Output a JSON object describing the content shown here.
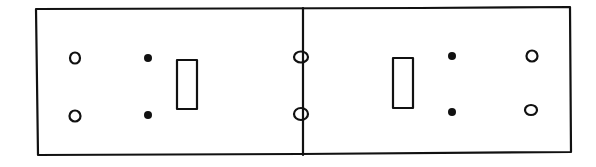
{
  "diagram": {
    "title": "",
    "stroke_color": "#111111",
    "background": "#ffffff",
    "frame": {
      "x": 36,
      "y": 8,
      "width": 535,
      "height": 147
    },
    "divider_x": 303,
    "plates": [
      {
        "name": "left",
        "screw_holes": [
          {
            "cx": 74,
            "cy": 58
          },
          {
            "cx": 75,
            "cy": 116
          }
        ],
        "dots": [
          {
            "cx": 148,
            "cy": 58
          },
          {
            "cx": 148,
            "cy": 115
          }
        ],
        "toggle_slot": {
          "x": 177,
          "y": 60,
          "width": 20,
          "height": 49
        }
      },
      {
        "name": "right",
        "screw_holes": [
          {
            "cx": 532,
            "cy": 56
          },
          {
            "cx": 531,
            "cy": 110
          }
        ],
        "dots": [
          {
            "cx": 452,
            "cy": 56
          },
          {
            "cx": 452,
            "cy": 112
          }
        ],
        "toggle_slot": {
          "x": 393,
          "y": 58,
          "width": 20,
          "height": 50
        }
      }
    ],
    "shared_holes": [
      {
        "cx": 301,
        "cy": 57
      },
      {
        "cx": 301,
        "cy": 114
      }
    ]
  }
}
